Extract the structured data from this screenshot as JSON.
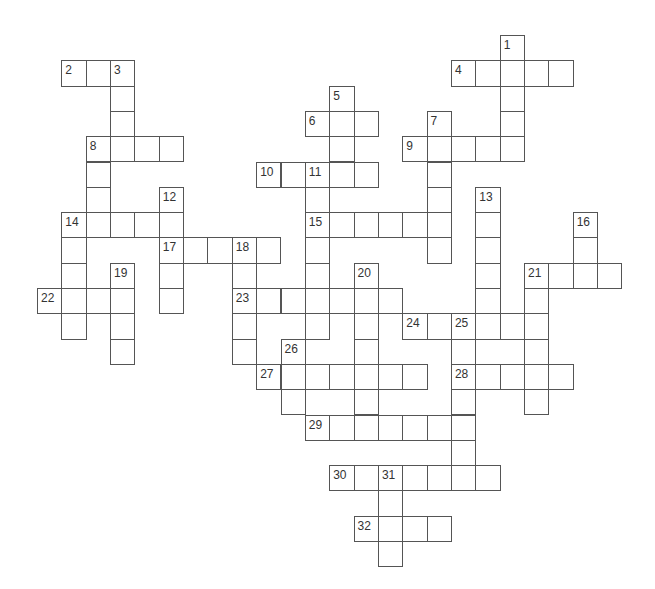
{
  "puzzle": {
    "type": "crossword",
    "grid": {
      "origin_x": 37,
      "origin_y": 35,
      "pitch_x": 24.35,
      "pitch_y": 25.3
    },
    "colors": {
      "border": "#555555",
      "cell_bg": "#ffffff",
      "number": "#333333"
    },
    "words": [
      {
        "number": "1",
        "direction": "down",
        "col": 19,
        "row": 0,
        "length": 5
      },
      {
        "number": "2",
        "direction": "across",
        "col": 1,
        "row": 1,
        "length": 3
      },
      {
        "number": "3",
        "direction": "down",
        "col": 3,
        "row": 1,
        "length": 4
      },
      {
        "number": "4",
        "direction": "across",
        "col": 17,
        "row": 1,
        "length": 5
      },
      {
        "number": "5",
        "direction": "down",
        "col": 12,
        "row": 2,
        "length": 4
      },
      {
        "number": "6",
        "direction": "across",
        "col": 11,
        "row": 3,
        "length": 3
      },
      {
        "number": "7",
        "direction": "down",
        "col": 16,
        "row": 3,
        "length": 6
      },
      {
        "number": "8",
        "direction": "across",
        "col": 2,
        "row": 4,
        "length": 4
      },
      {
        "number": "8",
        "direction": "down",
        "col": 2,
        "row": 4,
        "length": 4
      },
      {
        "number": "9",
        "direction": "across",
        "col": 15,
        "row": 4,
        "length": 5
      },
      {
        "number": "10",
        "direction": "across",
        "col": 9,
        "row": 5,
        "length": 5
      },
      {
        "number": "11",
        "direction": "down",
        "col": 11,
        "row": 5,
        "length": 7
      },
      {
        "number": "12",
        "direction": "down",
        "col": 5,
        "row": 6,
        "length": 5
      },
      {
        "number": "13",
        "direction": "down",
        "col": 18,
        "row": 6,
        "length": 6
      },
      {
        "number": "14",
        "direction": "across",
        "col": 1,
        "row": 7,
        "length": 5
      },
      {
        "number": "14",
        "direction": "down",
        "col": 1,
        "row": 7,
        "length": 5
      },
      {
        "number": "15",
        "direction": "across",
        "col": 11,
        "row": 7,
        "length": 6
      },
      {
        "number": "16",
        "direction": "down",
        "col": 22,
        "row": 7,
        "length": 3
      },
      {
        "number": "17",
        "direction": "across",
        "col": 5,
        "row": 8,
        "length": 5
      },
      {
        "number": "18",
        "direction": "down",
        "col": 8,
        "row": 8,
        "length": 5
      },
      {
        "number": "19",
        "direction": "down",
        "col": 3,
        "row": 9,
        "length": 4
      },
      {
        "number": "20",
        "direction": "down",
        "col": 13,
        "row": 9,
        "length": 7
      },
      {
        "number": "21",
        "direction": "across",
        "col": 20,
        "row": 9,
        "length": 4
      },
      {
        "number": "21",
        "direction": "down",
        "col": 20,
        "row": 9,
        "length": 6
      },
      {
        "number": "22",
        "direction": "across",
        "col": 0,
        "row": 10,
        "length": 4
      },
      {
        "number": "23",
        "direction": "across",
        "col": 8,
        "row": 10,
        "length": 7
      },
      {
        "number": "24",
        "direction": "across",
        "col": 15,
        "row": 11,
        "length": 6
      },
      {
        "number": "25",
        "direction": "down",
        "col": 17,
        "row": 11,
        "length": 7
      },
      {
        "number": "26",
        "direction": "down",
        "col": 10,
        "row": 12,
        "length": 3
      },
      {
        "number": "27",
        "direction": "across",
        "col": 9,
        "row": 13,
        "length": 7
      },
      {
        "number": "28",
        "direction": "across",
        "col": 17,
        "row": 13,
        "length": 5
      },
      {
        "number": "29",
        "direction": "across",
        "col": 11,
        "row": 15,
        "length": 7
      },
      {
        "number": "30",
        "direction": "across",
        "col": 12,
        "row": 17,
        "length": 7
      },
      {
        "number": "31",
        "direction": "down",
        "col": 14,
        "row": 17,
        "length": 4
      },
      {
        "number": "32",
        "direction": "across",
        "col": 13,
        "row": 19,
        "length": 4
      }
    ]
  }
}
